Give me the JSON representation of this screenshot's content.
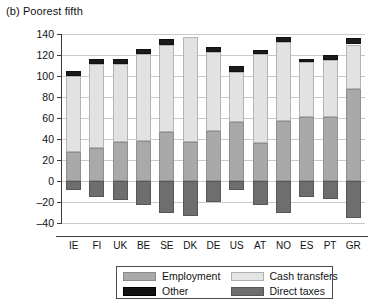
{
  "panel": {
    "title": "(b) Poorest fifth"
  },
  "chart_data": {
    "type": "bar",
    "subtype": "stacked-bar-with-negative",
    "title": "(b) Poorest fifth",
    "xlabel": "",
    "ylabel": "Percentage of total",
    "ylim": [
      -40,
      140
    ],
    "ytick_step": 20,
    "yticks": [
      140,
      120,
      100,
      80,
      60,
      40,
      20,
      0,
      -20,
      -40
    ],
    "grid": true,
    "legend_position": "bottom",
    "categories": [
      "IE",
      "FI",
      "UK",
      "BE",
      "SE",
      "DK",
      "DE",
      "US",
      "AT",
      "NO",
      "ES",
      "PT",
      "GR"
    ],
    "series": [
      {
        "name": "Employment",
        "color": "#a9a9a9",
        "values": [
          28,
          31,
          37,
          38,
          47,
          37,
          48,
          56,
          36,
          57,
          61,
          61,
          88
        ]
      },
      {
        "name": "Cash transfers",
        "color": "#e2e2e2",
        "values": [
          72,
          80,
          74,
          83,
          83,
          100,
          75,
          48,
          85,
          75,
          52,
          54,
          42
        ]
      },
      {
        "name": "Other",
        "color": "#1b1b1b",
        "values": [
          5,
          5,
          5,
          5,
          5,
          0,
          5,
          6,
          4,
          5,
          3,
          5,
          6
        ]
      },
      {
        "name": "Direct taxes",
        "color": "#6e6e6e",
        "values": [
          -9,
          -15,
          -18,
          -23,
          -30,
          -33,
          -20,
          -9,
          -23,
          -30,
          -15,
          -17,
          -35
        ]
      }
    ],
    "totals": [
      105,
      116,
      116,
      126,
      135,
      137,
      128,
      110,
      125,
      137,
      116,
      120,
      136
    ]
  },
  "legend": {
    "items": [
      {
        "label": "Employment",
        "swatch": "employment"
      },
      {
        "label": "Cash transfers",
        "swatch": "cash"
      },
      {
        "label": "Other",
        "swatch": "other"
      },
      {
        "label": "Direct taxes",
        "swatch": "taxes"
      }
    ]
  }
}
